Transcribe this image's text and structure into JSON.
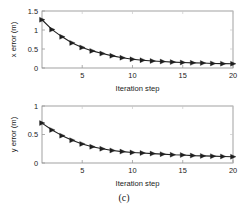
{
  "figure": {
    "caption": "(c)",
    "background_color": "#ffffff",
    "line_color": "#1f1f1f",
    "frame_color": "#8a8a8a"
  },
  "chart_data": [
    {
      "type": "line",
      "title": "",
      "subtitle": "",
      "xlabel": "Iteration step",
      "ylabel": "x error (m)",
      "xlim": [
        1,
        20
      ],
      "ylim": [
        0,
        1.5
      ],
      "xticks": [
        5,
        10,
        15,
        20
      ],
      "xticklabels": [
        "5",
        "10",
        "15",
        "20"
      ],
      "yticks": [
        0,
        0.5,
        1,
        1.5
      ],
      "yticklabels": [
        "0",
        "0.5",
        "1",
        "1.5"
      ],
      "grid": false,
      "legend": null,
      "marker": "right-triangle",
      "x": [
        1,
        2,
        3,
        4,
        5,
        6,
        7,
        8,
        9,
        10,
        11,
        12,
        13,
        14,
        15,
        16,
        17,
        18,
        19,
        20
      ],
      "values": [
        1.27,
        1.01,
        0.82,
        0.66,
        0.54,
        0.45,
        0.38,
        0.32,
        0.27,
        0.23,
        0.205,
        0.185,
        0.17,
        0.155,
        0.145,
        0.135,
        0.13,
        0.12,
        0.115,
        0.11
      ]
    },
    {
      "type": "line",
      "title": "",
      "subtitle": "",
      "xlabel": "Iteration step",
      "ylabel": "y error (m)",
      "xlim": [
        1,
        20
      ],
      "ylim": [
        0,
        1
      ],
      "xticks": [
        5,
        10,
        15,
        20
      ],
      "xticklabels": [
        "5",
        "10",
        "15",
        "20"
      ],
      "yticks": [
        0,
        0.5,
        1
      ],
      "yticklabels": [
        "0",
        "0.5",
        "1"
      ],
      "grid": false,
      "legend": null,
      "marker": "right-triangle",
      "x": [
        1,
        2,
        3,
        4,
        5,
        6,
        7,
        8,
        9,
        10,
        11,
        12,
        13,
        14,
        15,
        16,
        17,
        18,
        19,
        20
      ],
      "values": [
        0.7,
        0.58,
        0.48,
        0.4,
        0.335,
        0.285,
        0.25,
        0.22,
        0.2,
        0.185,
        0.175,
        0.165,
        0.155,
        0.145,
        0.14,
        0.13,
        0.125,
        0.12,
        0.115,
        0.11
      ]
    }
  ]
}
